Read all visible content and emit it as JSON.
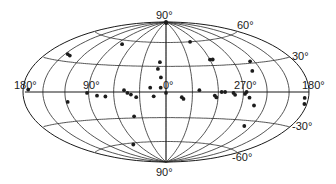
{
  "chart_data": {
    "type": "scatter",
    "projection": "Hammer-Aitoff all-sky (galactic coordinates)",
    "title": "",
    "grid": {
      "longitude_step_deg": 30,
      "latitude_lines_deg": [
        -60,
        -30,
        0,
        30,
        60
      ]
    },
    "labels": {
      "north_pole": "90°",
      "south_pole": "90°",
      "lon_left": "180°",
      "lon_90": "90°",
      "lon_0": "0°",
      "lon_270": "270°",
      "lon_right": "180°",
      "lat_60": "60°",
      "lat_30": "30°",
      "lat_m30": "-30°",
      "lat_m60": "-60°"
    },
    "points": [
      {
        "l": 172,
        "b": 2
      },
      {
        "l": 140,
        "b": 36
      },
      {
        "l": 146,
        "b": 37
      },
      {
        "l": 80,
        "b": 55
      },
      {
        "l": 92,
        "b": -1
      },
      {
        "l": 118,
        "b": -10
      },
      {
        "l": 80,
        "b": -4
      },
      {
        "l": 70,
        "b": -5
      },
      {
        "l": 48,
        "b": 2
      },
      {
        "l": 44,
        "b": -1
      },
      {
        "l": 40,
        "b": -3
      },
      {
        "l": 34,
        "b": -6
      },
      {
        "l": 18,
        "b": 5
      },
      {
        "l": 14,
        "b": -5
      },
      {
        "l": 0,
        "b": -1
      },
      {
        "l": 6,
        "b": 5
      },
      {
        "l": 6,
        "b": 17
      },
      {
        "l": 10,
        "b": 27
      },
      {
        "l": 8,
        "b": 35
      },
      {
        "l": 2,
        "b": 90
      },
      {
        "l": 355,
        "b": 88
      },
      {
        "l": 312,
        "b": 60
      },
      {
        "l": 300,
        "b": 37
      },
      {
        "l": 296,
        "b": 37
      },
      {
        "l": 246,
        "b": 32
      },
      {
        "l": 252,
        "b": 22
      },
      {
        "l": 342,
        "b": -6
      },
      {
        "l": 340,
        "b": -8
      },
      {
        "l": 322,
        "b": 2
      },
      {
        "l": 304,
        "b": -4
      },
      {
        "l": 302,
        "b": -6
      },
      {
        "l": 296,
        "b": 0
      },
      {
        "l": 292,
        "b": 0
      },
      {
        "l": 282,
        "b": -1
      },
      {
        "l": 280,
        "b": -3
      },
      {
        "l": 268,
        "b": -2
      },
      {
        "l": 266,
        "b": 0
      },
      {
        "l": 262,
        "b": -6
      },
      {
        "l": 254,
        "b": -14
      },
      {
        "l": 250,
        "b": -36
      },
      {
        "l": 186,
        "b": -5
      },
      {
        "l": 184,
        "b": -10
      },
      {
        "l": 70,
        "b": -62
      },
      {
        "l": 40,
        "b": -28
      }
    ],
    "colors": {
      "ink": "#1a1a1a",
      "background": "#ffffff"
    }
  }
}
